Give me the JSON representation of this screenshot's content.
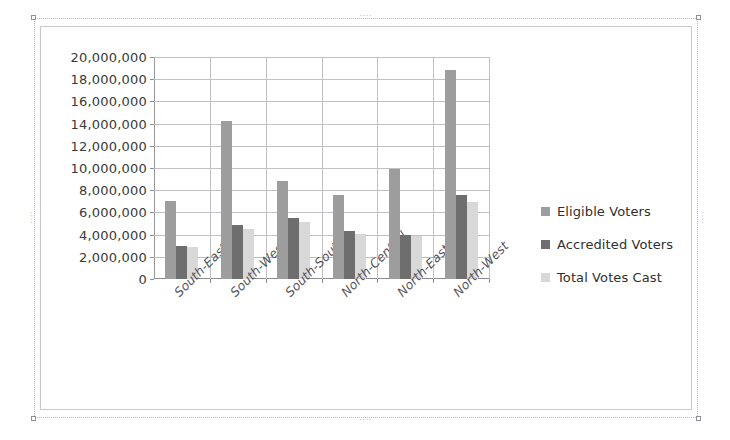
{
  "chart_data": {
    "type": "bar",
    "title": "",
    "xlabel": "",
    "ylabel": "",
    "grid": true,
    "legend_position": "right",
    "ylim": [
      0,
      20000000
    ],
    "ytick_step": 2000000,
    "categories": [
      "South-East",
      "South-West",
      "South-South",
      "North-Central",
      "North-East",
      "North-West"
    ],
    "ytick_labels": [
      "0",
      "2,000,000",
      "4,000,000",
      "6,000,000",
      "8,000,000",
      "10,000,000",
      "12,000,000",
      "14,000,000",
      "16,000,000",
      "18,000,000",
      "20,000,000"
    ],
    "ytick_values": [
      0,
      2000000,
      4000000,
      6000000,
      8000000,
      10000000,
      12000000,
      14000000,
      16000000,
      18000000,
      20000000
    ],
    "series": [
      {
        "name": "Eligible Voters",
        "color": "#9d9d9d",
        "values": [
          7000000,
          14200000,
          8800000,
          7600000,
          9950000,
          18800000
        ]
      },
      {
        "name": "Accredited Voters",
        "color": "#6e6e6e",
        "values": [
          3000000,
          4850000,
          5500000,
          4300000,
          4000000,
          7600000
        ]
      },
      {
        "name": "Total Votes Cast",
        "color": "#d8d8d8",
        "values": [
          2850000,
          4550000,
          5100000,
          4050000,
          3900000,
          6900000
        ]
      }
    ]
  },
  "selection": {
    "handle_dots": "····"
  }
}
